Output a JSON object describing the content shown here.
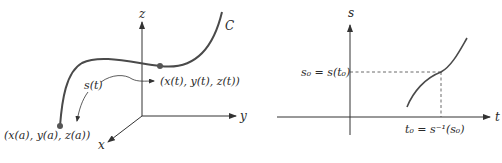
{
  "left_figure": {
    "axes": {
      "z_label": "z",
      "y_label": "y",
      "x_label": "x"
    },
    "curve_label": "C",
    "arc_length_label": "s(t)",
    "moving_point_label": "(x(t), y(t), z(t))",
    "start_point_label": "(x(a), y(a), z(a))"
  },
  "right_figure": {
    "axes": {
      "vertical_label": "s",
      "horizontal_label": "t"
    },
    "s0_label": "s₀ = s(t₀)",
    "t0_label": "t₀ = s⁻¹(s₀)"
  },
  "colors": {
    "curve": "#4a4a4a",
    "axes": "#333333",
    "point": "#555555",
    "background": "#ffffff"
  }
}
